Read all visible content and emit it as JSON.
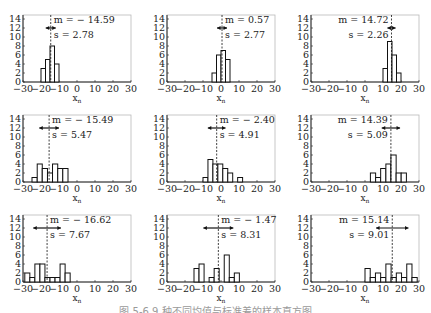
{
  "figure": {
    "caption": "图 5-6 9 种不同均值与标准差的样本直方图"
  },
  "chart_data": [
    {
      "type": "bar",
      "panel": 1,
      "xlabel": "x_n",
      "ylabel": "",
      "xlim": [
        -30,
        30
      ],
      "ylim": [
        0,
        14
      ],
      "xticks": [
        -30,
        -20,
        -10,
        0,
        10,
        20,
        30
      ],
      "yticks": [
        0,
        2,
        4,
        6,
        8,
        10,
        12,
        14
      ],
      "annotations": {
        "mean_label": "m = − 14.59",
        "std_label": "s = 2.78"
      },
      "mean": -14.59,
      "std": 2.78,
      "bins": {
        "edges": [
          -20,
          -17.5,
          -15,
          -12.5,
          -10
        ],
        "counts": [
          3,
          5,
          8,
          4
        ]
      },
      "label_side": "right"
    },
    {
      "type": "bar",
      "panel": 2,
      "xlabel": "x_n",
      "ylabel": "",
      "xlim": [
        -30,
        30
      ],
      "ylim": [
        0,
        14
      ],
      "xticks": [
        -30,
        -20,
        -10,
        0,
        10,
        20,
        30
      ],
      "yticks": [
        0,
        2,
        4,
        6,
        8,
        10,
        12,
        14
      ],
      "annotations": {
        "mean_label": "m = 0.57",
        "std_label": "s = 2.77"
      },
      "mean": 0.57,
      "std": 2.77,
      "bins": {
        "edges": [
          -5,
          -2.5,
          0,
          2.5,
          5
        ],
        "counts": [
          2,
          6,
          7,
          5
        ]
      },
      "label_side": "right"
    },
    {
      "type": "bar",
      "panel": 3,
      "xlabel": "x_n",
      "ylabel": "",
      "xlim": [
        -30,
        30
      ],
      "ylim": [
        0,
        14
      ],
      "xticks": [
        -30,
        -20,
        -10,
        0,
        10,
        20,
        30
      ],
      "yticks": [
        0,
        2,
        4,
        6,
        8,
        10,
        12,
        14
      ],
      "annotations": {
        "mean_label": "m = 14.72",
        "std_label": "s = 2.26"
      },
      "mean": 14.72,
      "std": 2.26,
      "bins": {
        "edges": [
          10,
          12.5,
          15,
          17.5,
          20
        ],
        "counts": [
          3,
          9,
          6,
          2
        ]
      },
      "label_side": "left"
    },
    {
      "type": "bar",
      "panel": 4,
      "xlabel": "x_n",
      "ylabel": "",
      "xlim": [
        -30,
        30
      ],
      "ylim": [
        0,
        14
      ],
      "xticks": [
        -30,
        -20,
        -10,
        0,
        10,
        20,
        30
      ],
      "yticks": [
        0,
        2,
        4,
        6,
        8,
        10,
        12,
        14
      ],
      "annotations": {
        "mean_label": "m = − 15.49",
        "std_label": "s = 5.47"
      },
      "mean": -15.49,
      "std": 5.47,
      "bins": {
        "edges": [
          -25,
          -22.1,
          -19.3,
          -16.4,
          -13.6,
          -10.7,
          -7.9,
          -5
        ],
        "counts": [
          1,
          4,
          3,
          2,
          4,
          3,
          3
        ]
      },
      "label_side": "right"
    },
    {
      "type": "bar",
      "panel": 5,
      "xlabel": "x_n",
      "ylabel": "",
      "xlim": [
        -30,
        30
      ],
      "ylim": [
        0,
        14
      ],
      "xticks": [
        -30,
        -20,
        -10,
        0,
        10,
        20,
        30
      ],
      "yticks": [
        0,
        2,
        4,
        6,
        8,
        10,
        12,
        14
      ],
      "annotations": {
        "mean_label": "m = − 2.40",
        "std_label": "s = 4.91"
      },
      "mean": -2.4,
      "std": 4.91,
      "bins": {
        "edges": [
          -10,
          -7.25,
          -4.5,
          -1.75,
          1,
          3.75,
          6.5,
          9.25,
          12
        ],
        "counts": [
          1,
          5,
          4,
          4,
          3,
          2,
          0,
          1
        ]
      },
      "label_side": "right"
    },
    {
      "type": "bar",
      "panel": 6,
      "xlabel": "x_n",
      "ylabel": "",
      "xlim": [
        -30,
        30
      ],
      "ylim": [
        0,
        14
      ],
      "xticks": [
        -30,
        -20,
        -10,
        0,
        10,
        20,
        30
      ],
      "yticks": [
        0,
        2,
        4,
        6,
        8,
        10,
        12,
        14
      ],
      "annotations": {
        "mean_label": "m = 14.39",
        "std_label": "s = 5.09"
      },
      "mean": 14.39,
      "std": 5.09,
      "bins": {
        "edges": [
          3,
          5.9,
          8.7,
          11.6,
          14.4,
          17.3,
          20.1,
          23
        ],
        "counts": [
          2,
          1,
          3,
          4,
          6,
          2,
          2
        ]
      },
      "label_side": "left"
    },
    {
      "type": "bar",
      "panel": 7,
      "xlabel": "x_n",
      "ylabel": "",
      "xlim": [
        -30,
        30
      ],
      "ylim": [
        0,
        14
      ],
      "xticks": [
        -30,
        -20,
        -10,
        0,
        10,
        20,
        30
      ],
      "yticks": [
        0,
        2,
        4,
        6,
        8,
        10,
        12,
        14
      ],
      "annotations": {
        "mean_label": "m = − 16.62",
        "std_label": "s = 7.67"
      },
      "mean": -16.62,
      "std": 7.67,
      "bins": {
        "edges": [
          -29,
          -26.2,
          -23.4,
          -20.6,
          -17.8,
          -15,
          -12.2,
          -9.4,
          -6.6,
          -3.8
        ],
        "counts": [
          2,
          1,
          4,
          4,
          1,
          1,
          1,
          4,
          2
        ]
      },
      "label_side": "right"
    },
    {
      "type": "bar",
      "panel": 8,
      "xlabel": "x_n",
      "ylabel": "",
      "xlim": [
        -30,
        30
      ],
      "ylim": [
        0,
        14
      ],
      "xticks": [
        -30,
        -20,
        -10,
        0,
        10,
        20,
        30
      ],
      "yticks": [
        0,
        2,
        4,
        6,
        8,
        10,
        12,
        14
      ],
      "annotations": {
        "mean_label": "m = − 1.47",
        "std_label": "s = 8.31"
      },
      "mean": -1.47,
      "std": 8.31,
      "bins": {
        "edges": [
          -15,
          -12.2,
          -9.4,
          -6.6,
          -3.8,
          -1,
          1.8,
          4.6,
          7.4,
          10.2
        ],
        "counts": [
          3,
          4,
          0,
          1,
          3,
          0,
          6,
          1,
          2
        ]
      },
      "label_side": "right"
    },
    {
      "type": "bar",
      "panel": 9,
      "xlabel": "x_n",
      "ylabel": "",
      "xlim": [
        -30,
        30
      ],
      "ylim": [
        0,
        14
      ],
      "xticks": [
        -30,
        -20,
        -10,
        0,
        10,
        20,
        30
      ],
      "yticks": [
        0,
        2,
        4,
        6,
        8,
        10,
        12,
        14
      ],
      "annotations": {
        "mean_label": "m = 15.14",
        "std_label": "s = 9.01"
      },
      "mean": 15.14,
      "std": 9.01,
      "bins": {
        "edges": [
          0,
          2.9,
          5.8,
          8.7,
          11.6,
          14.5,
          17.4,
          20.3,
          23.2,
          26.1,
          29
        ],
        "counts": [
          3,
          1,
          2,
          1,
          4,
          1,
          2,
          1,
          4,
          1
        ]
      },
      "label_side": "left"
    }
  ]
}
